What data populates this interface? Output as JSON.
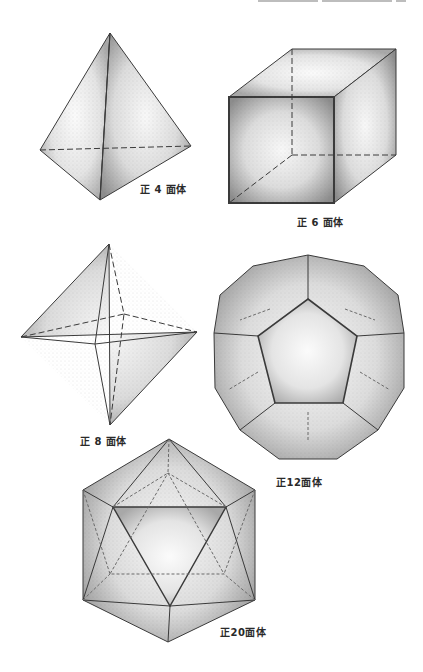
{
  "page": {
    "figures": [
      {
        "id": "tetrahedron",
        "label": "正 4 面体"
      },
      {
        "id": "hexahedron",
        "label": "正 6 面体"
      },
      {
        "id": "octahedron",
        "label": "正 8 面体"
      },
      {
        "id": "dodecahedron",
        "label": "正12面体"
      },
      {
        "id": "icosahedron",
        "label": "正20面体"
      }
    ]
  },
  "colors": {
    "ink": "#3a3a3a",
    "stipple_dark": "#8a8a8a",
    "stipple_light": "#f2f2f2",
    "background": "#ffffff"
  }
}
